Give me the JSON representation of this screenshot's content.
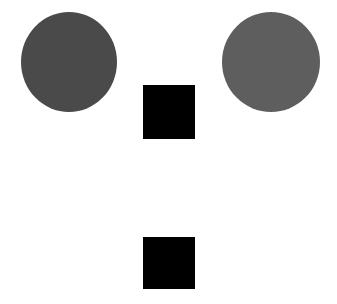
{
  "canvas": {
    "width": 337,
    "height": 304,
    "background": "#ffffff"
  },
  "shapes": [
    {
      "id": "circle-left",
      "type": "circle",
      "x": 21,
      "y": 12,
      "w": 96,
      "h": 100,
      "color": "#4a4a4a"
    },
    {
      "id": "circle-right",
      "type": "circle",
      "x": 222,
      "y": 12,
      "w": 98,
      "h": 100,
      "color": "#5e5e5e"
    },
    {
      "id": "square-top",
      "type": "square",
      "x": 143,
      "y": 85,
      "w": 52,
      "h": 54,
      "color": "#000000"
    },
    {
      "id": "square-bottom",
      "type": "square",
      "x": 143,
      "y": 237,
      "w": 52,
      "h": 52,
      "color": "#000000"
    }
  ]
}
